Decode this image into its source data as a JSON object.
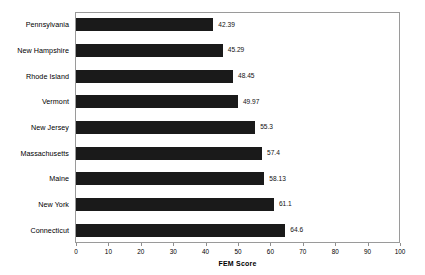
{
  "chart_data": {
    "type": "bar",
    "orientation": "horizontal",
    "title": "",
    "xlabel": "FEM Score",
    "ylabel": "",
    "xlim": [
      0,
      100
    ],
    "xticks": [
      0,
      10,
      20,
      30,
      40,
      50,
      60,
      70,
      80,
      90,
      100
    ],
    "grid": false,
    "legend": null,
    "bar_color": "#1a1a1a",
    "categories": [
      "Pennsylvania",
      "New Hampshire",
      "Rhode Island",
      "Vermont",
      "New Jersey",
      "Massachusetts",
      "Maine",
      "New York",
      "Connecticut"
    ],
    "values": [
      42.39,
      45.29,
      48.45,
      49.97,
      55.3,
      57.4,
      58.13,
      61.1,
      64.6
    ],
    "value_labels": [
      "42.39",
      "45.29",
      "48.45",
      "49.97",
      "55.3",
      "57.4",
      "58.13",
      "61.1",
      "64.6"
    ],
    "tick_labels": [
      "0",
      "10",
      "20",
      "30",
      "40",
      "50",
      "60",
      "70",
      "80",
      "90",
      "100"
    ]
  }
}
